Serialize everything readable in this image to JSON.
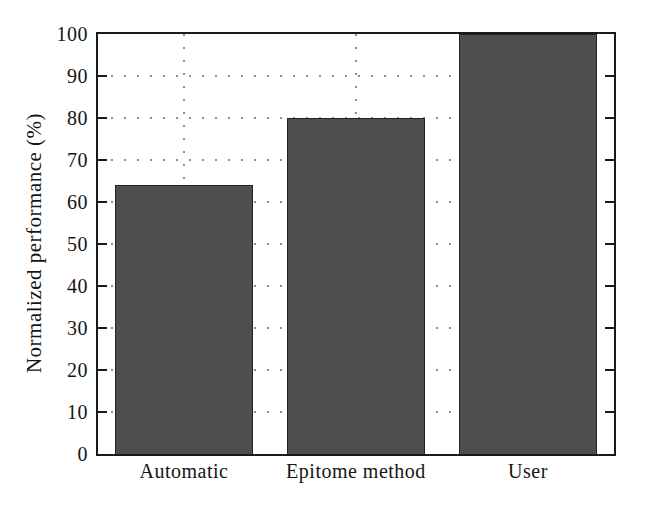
{
  "figure": {
    "background": "#ffffff"
  },
  "chart_data": {
    "type": "bar",
    "title": "",
    "categories": [
      "Automatic",
      "Epitome method",
      "User"
    ],
    "values": [
      64,
      80,
      100
    ],
    "xlabel": "",
    "ylabel": "Normalized performance (%)",
    "ylim": [
      0,
      100
    ],
    "ytick_step": 10,
    "ytick_labels": [
      "0",
      "10",
      "20",
      "30",
      "40",
      "50",
      "60",
      "70",
      "80",
      "90",
      "100"
    ],
    "grid": "dotted horizontal lines at every 10 units; dotted vertical lines at each bar center; inward tick marks on left and right axes",
    "legend": "none",
    "bar_width_frac": 0.8,
    "colors": {
      "bar_fill": "#4e4e4e",
      "bar_border": "#242424",
      "axis": "#1a1a1a",
      "grid_dot": "#8f8f8f",
      "text": "#151515",
      "background": "#ffffff"
    }
  }
}
